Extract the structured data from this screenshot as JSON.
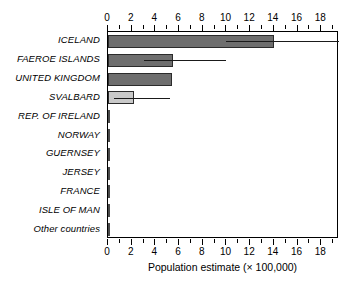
{
  "chart_data": {
    "type": "bar",
    "orientation": "horizontal",
    "title": "",
    "xlabel": "Population estimate (× 100,000)",
    "ylabel": "",
    "xlim": [
      0,
      19.5
    ],
    "xticks": [
      0,
      1,
      2,
      3,
      4,
      5,
      6,
      7,
      8,
      9,
      10,
      11,
      12,
      13,
      14,
      15,
      16,
      17,
      18,
      19
    ],
    "xtick_labels": [
      "0",
      "",
      "2",
      "",
      "4",
      "",
      "6",
      "",
      "8",
      "",
      "10",
      "",
      "12",
      "",
      "14",
      "",
      "16",
      "",
      "18",
      ""
    ],
    "grid": false,
    "legend": false,
    "axes_shown": [
      "top",
      "bottom"
    ],
    "categories": [
      "ICELAND",
      "FAEROE ISLANDS",
      "UNITED KINGDOM",
      "SVALBARD",
      "REP. OF IRELAND",
      "NORWAY",
      "GUERNSEY",
      "JERSEY",
      "FRANCE",
      "ISLE OF MAN",
      "Other countries"
    ],
    "values": [
      14.0,
      5.5,
      5.4,
      2.2,
      0.18,
      0.04,
      0.04,
      0.04,
      0.04,
      0.04,
      0.04
    ],
    "error_bars": [
      {
        "category": "ICELAND",
        "low": 10.0,
        "high": 19.5
      },
      {
        "category": "FAEROE ISLANDS",
        "low": 3.0,
        "high": 10.0
      },
      {
        "category": "SVALBARD",
        "low": 0.5,
        "high": 5.2
      }
    ],
    "bar_colors": [
      "#6e6e6e",
      "#6e6e6e",
      "#6e6e6e",
      "#c9c9c9",
      "#4a4a4a",
      "#4a4a4a",
      "#4a4a4a",
      "#4a4a4a",
      "#4a4a4a",
      "#4a4a4a",
      "#4a4a4a"
    ],
    "bar_edge_color": "#2b2b2b",
    "error_bar_color": "#1a1a1a"
  },
  "axis": {
    "x_title": "Population estimate (× 100,000)",
    "tick_labels": [
      "0",
      "2",
      "4",
      "6",
      "8",
      "10",
      "12",
      "14",
      "16",
      "18"
    ]
  },
  "categories": [
    {
      "label": "ICELAND"
    },
    {
      "label": "FAEROE ISLANDS"
    },
    {
      "label": "UNITED KINGDOM"
    },
    {
      "label": "SVALBARD"
    },
    {
      "label": "REP. OF IRELAND"
    },
    {
      "label": "NORWAY"
    },
    {
      "label": "GUERNSEY"
    },
    {
      "label": "JERSEY"
    },
    {
      "label": "FRANCE"
    },
    {
      "label": "ISLE OF MAN"
    },
    {
      "label": "Other countries"
    }
  ]
}
